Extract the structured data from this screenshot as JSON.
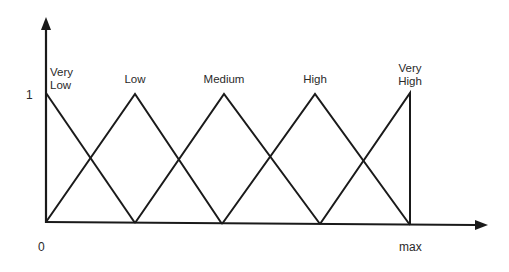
{
  "diagram": {
    "type": "fuzzy-membership-functions",
    "axes": {
      "y_tick_label": "1",
      "x_min_label": "0",
      "x_max_label": "max"
    },
    "sets": [
      {
        "name": "very_low",
        "label": "Very\nLow",
        "shape": "right-half-triangle",
        "points": [
          [
            0,
            1
          ],
          [
            1,
            0
          ]
        ]
      },
      {
        "name": "low",
        "label": "Low",
        "shape": "triangle",
        "points": [
          [
            0,
            0
          ],
          [
            1,
            1
          ],
          [
            2,
            0
          ]
        ]
      },
      {
        "name": "medium",
        "label": "Medium",
        "shape": "triangle",
        "points": [
          [
            1,
            0
          ],
          [
            2,
            1
          ],
          [
            3,
            0
          ]
        ]
      },
      {
        "name": "high",
        "label": "High",
        "shape": "triangle",
        "points": [
          [
            2,
            0
          ],
          [
            3,
            1
          ],
          [
            4,
            0
          ]
        ]
      },
      {
        "name": "very_high",
        "label": "Very\nHigh",
        "shape": "left-half-triangle",
        "points": [
          [
            3,
            0
          ],
          [
            4,
            1
          ],
          [
            4,
            0
          ]
        ]
      }
    ],
    "colors": {
      "line": "#1a1a1a",
      "text": "#2a2a2a",
      "background": "#ffffff"
    }
  }
}
